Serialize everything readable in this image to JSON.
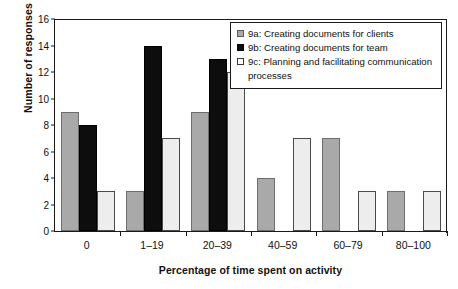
{
  "chart_data": {
    "type": "bar",
    "title": "",
    "xlabel": "Percentage of time spent on activity",
    "ylabel": "Number of responses",
    "categories": [
      "0",
      "1–19",
      "20–39",
      "40–59",
      "60–79",
      "80–100"
    ],
    "ylim": [
      0,
      16
    ],
    "yticks": [
      0,
      2,
      4,
      6,
      8,
      10,
      12,
      14,
      16
    ],
    "ytick_labels": [
      "0",
      "2",
      "4",
      "6",
      "8",
      "10",
      "12",
      "14",
      "16"
    ],
    "grid": false,
    "legend_position": "top-right",
    "series": [
      {
        "name": "9a: Creating documents for clients",
        "key": "9a",
        "color": "#a9a9a9",
        "values": [
          9,
          3,
          9,
          4,
          7,
          3
        ]
      },
      {
        "name": "9b: Creating documents for team",
        "key": "9b",
        "color": "#0d0d0d",
        "values": [
          8,
          14,
          13,
          0,
          0,
          0
        ]
      },
      {
        "name": "9c: Planning and facilitating communication processes",
        "key": "9c",
        "color": "#ededed",
        "values": [
          3,
          7,
          12,
          7,
          3,
          3
        ]
      }
    ]
  },
  "legend": {
    "entries": [
      "9a: Creating documents for clients",
      "9b: Creating documents for team",
      "9c: Planning and facilitating communication processes"
    ]
  },
  "axes": {
    "x_title": "Percentage of time spent on activity",
    "y_title": "Number of responses"
  }
}
